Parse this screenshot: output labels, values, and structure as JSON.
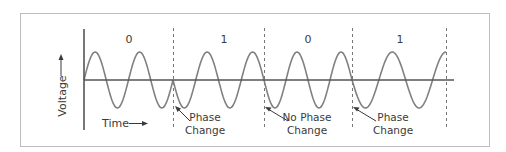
{
  "diagram": {
    "y_axis_label": "Voltage",
    "x_axis_label": "Time",
    "colors": {
      "frame": "#bdbdbd",
      "axis": "#555555",
      "wave": "#808080",
      "dashed": "#777777",
      "text": "#3a3a3a"
    },
    "bits": [
      {
        "label": "0",
        "x": 129
      },
      {
        "label": "1",
        "x": 224
      },
      {
        "label": "0",
        "x": 308
      },
      {
        "label": "1",
        "x": 400
      }
    ],
    "boundaries": [
      173,
      264,
      352,
      446
    ],
    "annotations": [
      {
        "line1": "Phase",
        "line2": "Change",
        "x": 205
      },
      {
        "line1": "No Phase",
        "line2": "Change",
        "x": 298
      },
      {
        "line1": "Phase",
        "line2": "Change",
        "x": 384
      }
    ]
  }
}
